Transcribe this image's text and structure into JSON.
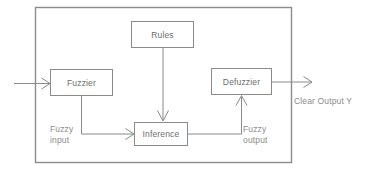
{
  "diagram": {
    "type": "block-diagram",
    "canvas": {
      "width": 368,
      "height": 172
    },
    "colors": {
      "background": "#ffffff",
      "stroke": "#8a8a8a",
      "outer_stroke": "#8c8c8c",
      "box_fill": "#ffffff",
      "box_text": "#6d6d6d",
      "free_text": "#8b8b8b"
    },
    "container": {
      "name": "system-boundary",
      "x": 35,
      "y": 7,
      "width": 257,
      "height": 156
    },
    "blocks": [
      {
        "id": "rules",
        "label": "Rules",
        "x": 131,
        "y": 21,
        "width": 63,
        "height": 27
      },
      {
        "id": "fuzzier",
        "label": "Fuzzier",
        "x": 50,
        "y": 69,
        "width": 63,
        "height": 27
      },
      {
        "id": "defuzzier",
        "label": "Defuzzier",
        "x": 211,
        "y": 68,
        "width": 61,
        "height": 27
      },
      {
        "id": "inference",
        "label": "Inference",
        "x": 134,
        "y": 122,
        "width": 54,
        "height": 24
      }
    ],
    "labels": [
      {
        "id": "fuzzy-input",
        "lines": [
          "Fuzzy",
          "input"
        ],
        "x": 50,
        "y": 124
      },
      {
        "id": "fuzzy-output",
        "lines": [
          "Fuzzy",
          "output"
        ],
        "x": 243,
        "y": 124
      },
      {
        "id": "clear-output",
        "lines": [
          "Clear Output Y"
        ],
        "x": 294,
        "y": 96
      }
    ],
    "connections": [
      {
        "id": "input-to-fuzzier",
        "from": "external-input",
        "to": "fuzzier",
        "style": "straight-horizontal",
        "arrow": "right"
      },
      {
        "id": "rules-to-inference",
        "from": "rules",
        "to": "inference",
        "style": "straight-vertical",
        "arrow": "down"
      },
      {
        "id": "fuzzier-to-inference",
        "from": "fuzzier",
        "to": "inference",
        "style": "orthogonal-down-right",
        "arrow": "right"
      },
      {
        "id": "inference-to-defuzzier",
        "from": "inference",
        "to": "defuzzier",
        "style": "orthogonal-right-up",
        "arrow": "up"
      },
      {
        "id": "defuzzier-to-output",
        "from": "defuzzier",
        "to": "external-output",
        "style": "straight-horizontal",
        "arrow": "right"
      }
    ]
  }
}
